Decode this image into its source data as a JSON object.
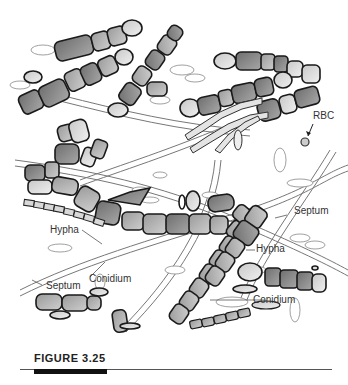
{
  "figure": {
    "caption": "FIGURE 3.25",
    "labels": {
      "rbc": "RBC",
      "septum_right": "Septum",
      "hypha_left": "Hypha",
      "hypha_right": "Hypha",
      "conidium_left": "Conidium",
      "conidium_right": "Conidium",
      "septum_left": "Septum"
    }
  },
  "colors": {
    "cell_dark": "#8a8a8a",
    "cell_mid": "#b0b0b0",
    "cell_light": "#dadada",
    "outline": "#1a1a1a",
    "hypha_line": "#777777",
    "background": "#ffffff"
  }
}
